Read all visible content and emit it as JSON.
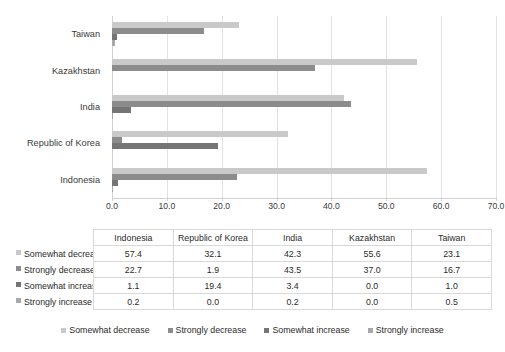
{
  "chart_data": {
    "type": "bar",
    "orientation": "horizontal",
    "title": "",
    "xlabel": "",
    "ylabel": "",
    "xlim": [
      0,
      70
    ],
    "xticks": [
      "0.0",
      "10.0",
      "20.0",
      "30.0",
      "40.0",
      "50.0",
      "60.0",
      "70.0"
    ],
    "grid": true,
    "legend_position": "bottom",
    "categories": [
      "Indonesia",
      "Republic of Korea",
      "India",
      "Kazakhstan",
      "Taiwan"
    ],
    "categories_plot_order": [
      "Taiwan",
      "Kazakhstan",
      "India",
      "Republic of Korea",
      "Indonesia"
    ],
    "series": [
      {
        "name": "Somewhat decrease",
        "color": "#c9c9c9",
        "values": [
          57.4,
          32.1,
          42.3,
          55.6,
          23.1
        ],
        "labels": [
          "57.4",
          "32.1",
          "42.3",
          "55.6",
          "23.1"
        ]
      },
      {
        "name": "Strongly decrease",
        "color": "#8c8c8c",
        "values": [
          22.7,
          1.9,
          43.5,
          37.0,
          16.7
        ],
        "labels": [
          "22.7",
          "1.9",
          "43.5",
          "37.0",
          "16.7"
        ]
      },
      {
        "name": "Somewhat increase",
        "color": "#757575",
        "values": [
          1.1,
          19.4,
          3.4,
          0.0,
          1.0
        ],
        "labels": [
          "1.1",
          "19.4",
          "3.4",
          "0.0",
          "1.0"
        ]
      },
      {
        "name": "Strongly increase",
        "color": "#a8a8a8",
        "values": [
          0.2,
          0.0,
          0.2,
          0.0,
          0.5
        ],
        "labels": [
          "0.2",
          "0.0",
          "0.2",
          "0.0",
          "0.5"
        ]
      }
    ]
  },
  "table": {
    "corner_label": "",
    "column_headers": [
      "Indonesia",
      "Republic of Korea",
      "India",
      "Kazakhstan",
      "Taiwan"
    ],
    "rows": [
      {
        "label": "Somewhat decrease",
        "color": "#c9c9c9",
        "values": [
          "57.4",
          "32.1",
          "42.3",
          "55.6",
          "23.1"
        ]
      },
      {
        "label": "Strongly decrease",
        "color": "#8c8c8c",
        "values": [
          "22.7",
          "1.9",
          "43.5",
          "37.0",
          "16.7"
        ]
      },
      {
        "label": "Somewhat increase",
        "color": "#757575",
        "values": [
          "1.1",
          "19.4",
          "3.4",
          "0.0",
          "1.0"
        ]
      },
      {
        "label": "Strongly increase",
        "color": "#a8a8a8",
        "values": [
          "0.2",
          "0.0",
          "0.2",
          "0.0",
          "0.5"
        ]
      }
    ]
  },
  "legend": {
    "items": [
      {
        "label": "Somewhat decrease",
        "color": "#c9c9c9"
      },
      {
        "label": "Strongly decrease",
        "color": "#8c8c8c"
      },
      {
        "label": "Somewhat increase",
        "color": "#757575"
      },
      {
        "label": "Strongly increase",
        "color": "#a8a8a8"
      }
    ]
  },
  "colors": {
    "gridline": "#e3e3e3",
    "axis": "#d2d2d2",
    "text": "#2b2b2b",
    "table_border": "#d9d9d9",
    "background": "#ffffff"
  }
}
